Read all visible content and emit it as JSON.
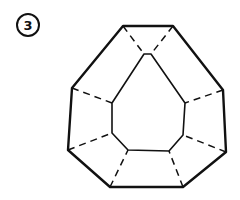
{
  "figure": {
    "label": "3",
    "stroke_color": "#111111",
    "background": "#ffffff",
    "outer_polygon": [
      [
        123,
        26
      ],
      [
        173,
        26
      ],
      [
        223,
        90
      ],
      [
        226,
        152
      ],
      [
        183,
        187
      ],
      [
        110,
        187
      ],
      [
        68,
        150
      ],
      [
        72,
        88
      ]
    ],
    "inner_polygon": [
      [
        144,
        54
      ],
      [
        151,
        54
      ],
      [
        185,
        103
      ],
      [
        183,
        135
      ],
      [
        169,
        151
      ],
      [
        128,
        150
      ],
      [
        112,
        133
      ],
      [
        112,
        103
      ]
    ],
    "dashed_connectors": [
      [
        [
          123,
          26
        ],
        [
          144,
          54
        ]
      ],
      [
        [
          173,
          26
        ],
        [
          151,
          54
        ]
      ],
      [
        [
          223,
          90
        ],
        [
          185,
          103
        ]
      ],
      [
        [
          226,
          152
        ],
        [
          183,
          135
        ]
      ],
      [
        [
          183,
          187
        ],
        [
          169,
          151
        ]
      ],
      [
        [
          110,
          187
        ],
        [
          128,
          150
        ]
      ],
      [
        [
          68,
          150
        ],
        [
          112,
          133
        ]
      ],
      [
        [
          72,
          88
        ],
        [
          112,
          103
        ]
      ]
    ]
  }
}
